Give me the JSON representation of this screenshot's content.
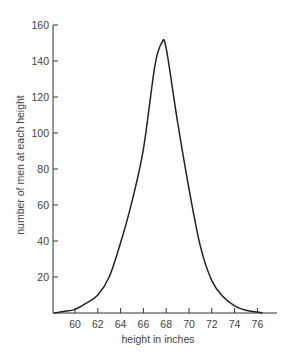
{
  "chart_data": {
    "type": "line",
    "title": "",
    "xlabel": "height in inches",
    "ylabel": "number of men at each height",
    "xlim": [
      58,
      78
    ],
    "ylim": [
      0,
      160
    ],
    "grid": false,
    "legend": null,
    "x_ticks": [
      60,
      62,
      64,
      66,
      68,
      70,
      72,
      74,
      76
    ],
    "y_ticks": [
      20,
      40,
      60,
      80,
      100,
      120,
      140,
      160
    ],
    "series": [
      {
        "name": "height distribution",
        "color": "#222222",
        "x": [
          58.2,
          59,
          60,
          61,
          62,
          63,
          64,
          65,
          66,
          67,
          67.6,
          68,
          69,
          70,
          71,
          72,
          73,
          74,
          75,
          76,
          76.4
        ],
        "values": [
          0,
          0.8,
          2,
          5.5,
          10,
          20,
          39,
          62,
          91,
          137,
          150,
          147,
          106,
          69,
          37,
          18,
          9,
          4,
          1.5,
          0.5,
          0
        ]
      }
    ],
    "annotations": []
  }
}
